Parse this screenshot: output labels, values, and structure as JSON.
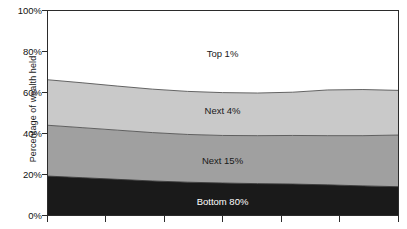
{
  "chart_data": {
    "type": "area",
    "stacked": true,
    "title": "",
    "subtitle": "",
    "xlabel": "",
    "ylabel": "Percentage of wealth held",
    "ylim": [
      0,
      100
    ],
    "y_ticks": [
      "0%",
      "20%",
      "40%",
      "60%",
      "80%",
      "100%"
    ],
    "y_tick_values": [
      0,
      20,
      40,
      60,
      80,
      100
    ],
    "x_ticks": [
      "",
      "",
      "",
      "",
      "",
      ""
    ],
    "grid": false,
    "legend_position": "inline-labels",
    "x": [
      0,
      1,
      2,
      3,
      4,
      5,
      6,
      7,
      8,
      9,
      10
    ],
    "series": [
      {
        "name": "Bottom 80%",
        "color": "#1a1a1a",
        "label_color": "#ffffff",
        "values": [
          19.0,
          18.2,
          17.4,
          16.6,
          16.0,
          15.6,
          15.3,
          15.1,
          14.7,
          14.2,
          13.8
        ]
      },
      {
        "name": "Next 15%",
        "color": "#a0a0a0",
        "label_color": "#1a1a1a",
        "values": [
          24.8,
          24.4,
          24.0,
          23.6,
          23.3,
          23.2,
          23.4,
          23.7,
          24.0,
          24.5,
          25.2
        ]
      },
      {
        "name": "Next 4%",
        "color": "#c9c9c9",
        "label_color": "#1a1a1a",
        "values": [
          22.2,
          21.9,
          21.5,
          21.2,
          21.0,
          20.9,
          20.8,
          21.1,
          22.3,
          22.5,
          21.8
        ]
      },
      {
        "name": "Top 1%",
        "color": "#ffffff",
        "label_color": "#1a1a1a",
        "values": [
          34.0,
          35.5,
          37.1,
          38.6,
          39.7,
          40.3,
          40.5,
          40.1,
          39.0,
          38.8,
          39.2
        ]
      }
    ],
    "cumulative_boundaries": {
      "bottom80_top": [
        19.0,
        18.2,
        17.4,
        16.6,
        16.0,
        15.6,
        15.3,
        15.1,
        14.7,
        14.2,
        13.8
      ],
      "next15_top": [
        43.8,
        42.6,
        41.4,
        40.2,
        39.3,
        38.8,
        38.7,
        38.8,
        38.7,
        38.7,
        39.0
      ],
      "next4_top": [
        66.0,
        64.5,
        62.9,
        61.4,
        60.3,
        59.7,
        59.5,
        59.9,
        61.0,
        61.2,
        60.8
      ],
      "top1_top": [
        100,
        100,
        100,
        100,
        100,
        100,
        100,
        100,
        100,
        100,
        100
      ]
    },
    "band_labels": [
      {
        "text": "Top 1%",
        "x_pct": 50.0,
        "y_pct": 78.0
      },
      {
        "text": "Next 4%",
        "x_pct": 50.0,
        "y_pct": 51.0
      },
      {
        "text": "Next 15%",
        "x_pct": 50.0,
        "y_pct": 26.5
      },
      {
        "text": "Bottom 80%",
        "x_pct": 50.0,
        "y_pct": 5.0
      }
    ]
  },
  "axis": {
    "y_title": "Percentage of wealth held",
    "y_tick_0": "0%",
    "y_tick_20": "20%",
    "y_tick_40": "40%",
    "y_tick_60": "60%",
    "y_tick_80": "80%",
    "y_tick_100": "100%"
  },
  "labels": {
    "top1": "Top 1%",
    "next4": "Next 4%",
    "next15": "Next 15%",
    "bottom80": "Bottom 80%"
  },
  "colors": {
    "bottom80": "#1a1a1a",
    "next15": "#a0a0a0",
    "next4": "#c9c9c9",
    "top1": "#ffffff",
    "axis": "#2b2b2b",
    "text": "#1a1a1a"
  }
}
